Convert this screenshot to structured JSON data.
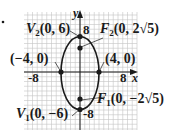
{
  "diagram": {
    "type": "ellipse-graph",
    "equation_center": [
      0,
      0
    ],
    "semi_major": 6,
    "semi_minor": 4,
    "major_axis": "vertical",
    "axes": {
      "x_label": "x",
      "y_label": "y"
    },
    "ticks": {
      "x_neg": "-8",
      "x_pos": "8",
      "y_pos": "8",
      "y_neg": "-8"
    },
    "points": {
      "V2": {
        "name": "V",
        "sub": "2",
        "coords": "(0, 6)"
      },
      "V1": {
        "name": "V",
        "sub": "1",
        "coords": "(0, −6)"
      },
      "F2": {
        "name": "F",
        "sub": "2",
        "coords": "(0, 2√5)"
      },
      "F1": {
        "name": "F",
        "sub": "1",
        "coords": "(0, −2√5)"
      },
      "left": {
        "coords": "(−4, 0)"
      },
      "right": {
        "coords": "(4, 0)"
      }
    },
    "colors": {
      "ink": "#1a1a1a",
      "grid": "#bdbdbd",
      "background": "#ffffff"
    }
  }
}
